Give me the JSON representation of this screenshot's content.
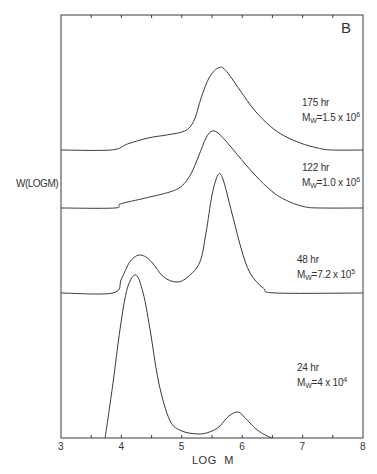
{
  "chart_data": {
    "type": "line",
    "title": "",
    "panel_label": "B",
    "xlabel": "LOG M",
    "ylabel": "W(LOGM)",
    "xlim": [
      3,
      8
    ],
    "xticks": [
      3,
      4,
      5,
      6,
      7,
      8
    ],
    "grid": false,
    "layout": "stacked offset curves, each with own baseline",
    "series": [
      {
        "name": "175 hr",
        "time": "175 hr",
        "mw_mantissa": "M",
        "mw_sub": "W",
        "mw_value": "=1.5 x 10",
        "mw_exp": "6",
        "baseline_px": 150,
        "label_pos": [
          302,
          97
        ],
        "points": [
          [
            3.0,
            0
          ],
          [
            3.83,
            0
          ],
          [
            4.1,
            6
          ],
          [
            4.44,
            12
          ],
          [
            4.75,
            15
          ],
          [
            5.0,
            18
          ],
          [
            5.12,
            22
          ],
          [
            5.22,
            32
          ],
          [
            5.32,
            52
          ],
          [
            5.45,
            72
          ],
          [
            5.6,
            82
          ],
          [
            5.72,
            80
          ],
          [
            5.96,
            60
          ],
          [
            6.2,
            40
          ],
          [
            6.46,
            24
          ],
          [
            6.7,
            14
          ],
          [
            6.96,
            7
          ],
          [
            7.25,
            2
          ],
          [
            7.49,
            0
          ],
          [
            8.0,
            0
          ]
        ]
      },
      {
        "name": "122 hr",
        "time": "122 hr",
        "mw_mantissa": "M",
        "mw_sub": "W",
        "mw_value": "=1.0 x 10",
        "mw_exp": "6",
        "baseline_px": 208,
        "label_pos": [
          302,
          162
        ],
        "points": [
          [
            3.0,
            0
          ],
          [
            3.89,
            0
          ],
          [
            3.98,
            4
          ],
          [
            4.4,
            10
          ],
          [
            4.8,
            16
          ],
          [
            5.0,
            22
          ],
          [
            5.15,
            34
          ],
          [
            5.28,
            52
          ],
          [
            5.4,
            70
          ],
          [
            5.5,
            77
          ],
          [
            5.62,
            74
          ],
          [
            5.8,
            62
          ],
          [
            6.05,
            44
          ],
          [
            6.29,
            28
          ],
          [
            6.55,
            14
          ],
          [
            6.79,
            6
          ],
          [
            7.05,
            1
          ],
          [
            7.32,
            0
          ],
          [
            8.0,
            0
          ]
        ]
      },
      {
        "name": "48 hr",
        "time": "48 hr",
        "mw_mantissa": "M",
        "mw_sub": "W",
        "mw_value": "=7.2 x 10",
        "mw_exp": "5",
        "baseline_px": 293,
        "label_pos": [
          297,
          254
        ],
        "points": [
          [
            3.0,
            0
          ],
          [
            3.86,
            0
          ],
          [
            4.0,
            14
          ],
          [
            4.15,
            32
          ],
          [
            4.32,
            38
          ],
          [
            4.5,
            31
          ],
          [
            4.7,
            16
          ],
          [
            4.92,
            11
          ],
          [
            5.1,
            16
          ],
          [
            5.3,
            31
          ],
          [
            5.4,
            60
          ],
          [
            5.5,
            98
          ],
          [
            5.6,
            118
          ],
          [
            5.68,
            114
          ],
          [
            5.83,
            80
          ],
          [
            5.98,
            45
          ],
          [
            6.13,
            20
          ],
          [
            6.35,
            5
          ],
          [
            6.56,
            0
          ],
          [
            8.0,
            0
          ]
        ]
      },
      {
        "name": "24 hr",
        "time": "24 hr",
        "mw_mantissa": "M",
        "mw_sub": "W",
        "mw_value": "=4 x 10",
        "mw_exp": "4",
        "baseline_px": 438,
        "label_pos": [
          297,
          362
        ],
        "points": [
          [
            3.73,
            0
          ],
          [
            3.85,
            50
          ],
          [
            3.98,
            110
          ],
          [
            4.1,
            150
          ],
          [
            4.24,
            163
          ],
          [
            4.36,
            145
          ],
          [
            4.47,
            110
          ],
          [
            4.62,
            55
          ],
          [
            4.8,
            18
          ],
          [
            5.0,
            7
          ],
          [
            5.3,
            4
          ],
          [
            5.5,
            7
          ],
          [
            5.63,
            12
          ],
          [
            5.78,
            22
          ],
          [
            5.93,
            26
          ],
          [
            6.05,
            20
          ],
          [
            6.21,
            10
          ],
          [
            6.35,
            4
          ],
          [
            6.49,
            0
          ]
        ]
      }
    ]
  },
  "axis": {
    "x_label": "LOG M",
    "y_label": "W(LOGM)",
    "tick_labels": [
      "3",
      "4",
      "5",
      "6",
      "7",
      "8"
    ]
  }
}
